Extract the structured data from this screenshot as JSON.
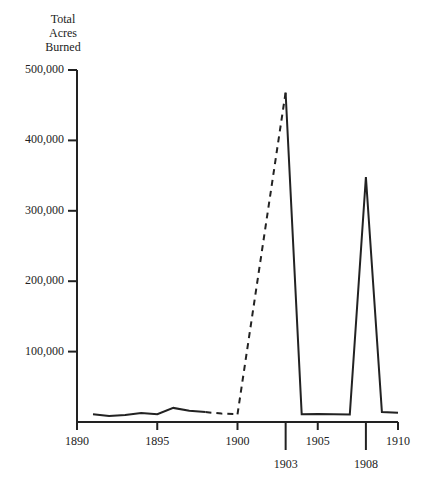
{
  "chart_data": {
    "type": "line",
    "title": "",
    "ylabel": "Total Acres Burned",
    "ylabel_lines": [
      "Total",
      "Acres",
      "Burned"
    ],
    "xlabel": "",
    "xlim": [
      1890,
      1910
    ],
    "ylim": [
      0,
      500000
    ],
    "grid": false,
    "legend": null,
    "y_ticks": [
      {
        "value": 100000,
        "label": "100,000"
      },
      {
        "value": 200000,
        "label": "200,000"
      },
      {
        "value": 300000,
        "label": "300,000"
      },
      {
        "value": 400000,
        "label": "400,000"
      },
      {
        "value": 500000,
        "label": "500,000"
      }
    ],
    "x_ticks": [
      {
        "value": 1890,
        "label": "1890",
        "long": false
      },
      {
        "value": 1895,
        "label": "1895",
        "long": false
      },
      {
        "value": 1900,
        "label": "1900",
        "long": false
      },
      {
        "value": 1903,
        "label": "1903",
        "long": true
      },
      {
        "value": 1905,
        "label": "1905",
        "long": false
      },
      {
        "value": 1908,
        "label": "1908",
        "long": true
      },
      {
        "value": 1910,
        "label": "1910",
        "long": false
      }
    ],
    "series": [
      {
        "name": "Total Acres Burned",
        "segments": [
          {
            "style": "solid",
            "x": [
              1891,
              1892,
              1893,
              1894,
              1895,
              1896,
              1897,
              1898
            ],
            "y": [
              11000,
              8500,
              10000,
              12800,
              11000,
              20000,
              16000,
              14000
            ]
          },
          {
            "style": "dashed",
            "x": [
              1898,
              1899,
              1900
            ],
            "y": [
              14000,
              12000,
              11000
            ]
          },
          {
            "style": "dashed",
            "x": [
              1900,
              1903
            ],
            "y": [
              11000,
              468000
            ]
          },
          {
            "style": "solid",
            "x": [
              1903,
              1904,
              1905,
              1906,
              1907,
              1908,
              1909,
              1910
            ],
            "y": [
              468000,
              11000,
              11500,
              11000,
              10500,
              348000,
              14000,
              13000
            ]
          }
        ]
      }
    ]
  }
}
